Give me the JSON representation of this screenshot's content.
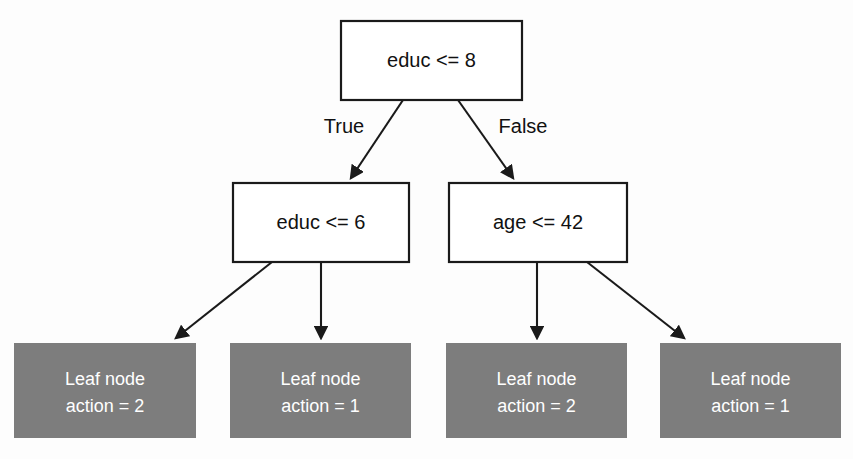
{
  "diagram": {
    "type": "decision-tree",
    "title": "",
    "colors": {
      "background": "#fdfdfd",
      "internal_node_fill": "#ffffff",
      "leaf_node_fill": "#7d7d7d",
      "stroke": "#1a1a1a",
      "leaf_text": "#ffffff",
      "node_text": "#111111"
    },
    "root": {
      "label": "educ <= 8"
    },
    "edge_labels": {
      "true": "True",
      "false": "False"
    },
    "internal_nodes": [
      {
        "label": "educ <= 6"
      },
      {
        "label": "age <= 42"
      }
    ],
    "leaves": [
      {
        "line1": "Leaf node",
        "line2": "action = 2"
      },
      {
        "line1": "Leaf node",
        "line2": "action = 1"
      },
      {
        "line1": "Leaf node",
        "line2": "action = 2"
      },
      {
        "line1": "Leaf node",
        "line2": "action = 1"
      }
    ]
  }
}
